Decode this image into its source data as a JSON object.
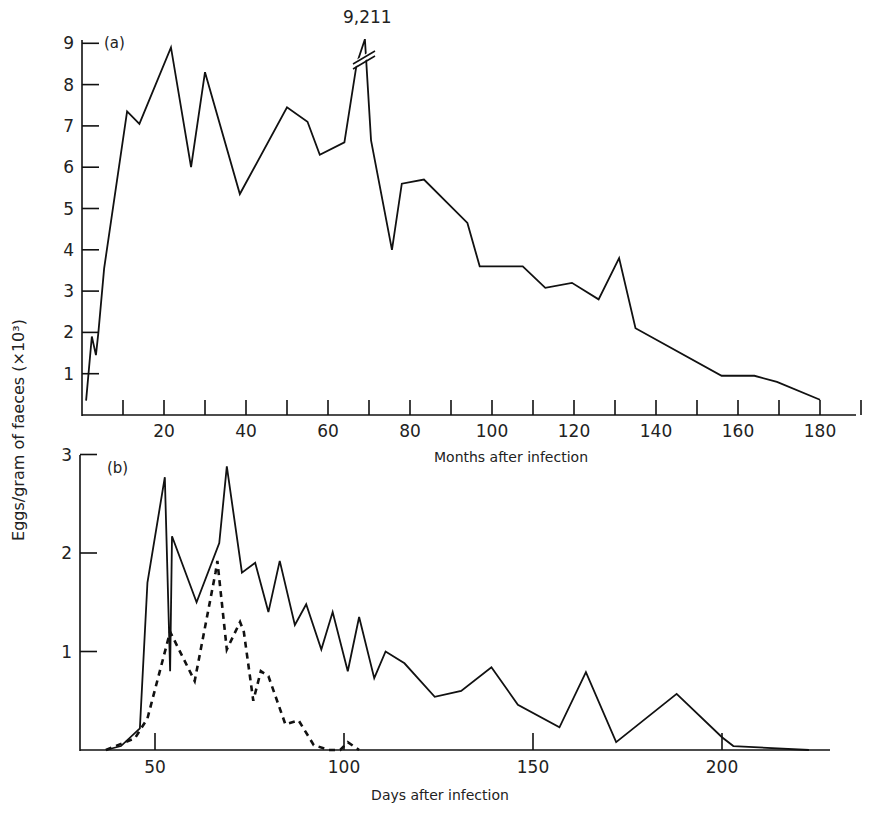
{
  "shared": {
    "ylabel": "Eggs/gram of faeces (×10³)"
  },
  "chart_data": [
    {
      "type": "line",
      "panel": "(a)",
      "title": "",
      "xlabel": "Months after infection",
      "ylabel": "Eggs/gram of faeces (×10³)",
      "xlim": [
        0,
        190
      ],
      "ylim": [
        0,
        9
      ],
      "x_ticks": [
        10,
        20,
        30,
        40,
        50,
        60,
        70,
        80,
        90,
        100,
        110,
        120,
        130,
        140,
        150,
        160,
        170,
        180,
        190
      ],
      "x_tick_labels": [
        "20",
        "40",
        "60",
        "80",
        "100",
        "120",
        "140",
        "160",
        "180"
      ],
      "x_tick_label_values": [
        20,
        40,
        60,
        80,
        100,
        120,
        140,
        160,
        180
      ],
      "y_ticks": [
        1,
        2,
        3,
        4,
        5,
        6,
        7,
        8,
        9
      ],
      "y_tick_labels": [
        "1",
        "2",
        "3",
        "4",
        "5",
        "6",
        "7",
        "8",
        "9"
      ],
      "grid": false,
      "annotations": [
        {
          "text": "9,211",
          "x": 69,
          "y": 9.211,
          "note": "axis break marks on peak"
        }
      ],
      "series": [
        {
          "name": "eggs",
          "style": "solid",
          "x": [
            1,
            2.4,
            3.4,
            4,
            5.4,
            11,
            14,
            21.7,
            26.6,
            30,
            38.5,
            50,
            55,
            58,
            64,
            67,
            69,
            70.5,
            75.6,
            78,
            83.4,
            94,
            97,
            107.5,
            113,
            119.5,
            126,
            131,
            135,
            156,
            164,
            169.5,
            180
          ],
          "values": [
            0.35,
            1.9,
            1.45,
            2.0,
            3.55,
            7.35,
            7.05,
            8.9,
            6.0,
            8.3,
            5.35,
            7.45,
            7.1,
            6.3,
            6.6,
            8.5,
            9.211,
            6.65,
            4.0,
            5.6,
            5.7,
            4.65,
            3.6,
            3.6,
            3.08,
            3.2,
            2.8,
            3.8,
            2.1,
            0.95,
            0.95,
            0.8,
            0.37
          ]
        }
      ]
    },
    {
      "type": "line",
      "panel": "(b)",
      "title": "",
      "xlabel": "Days after infection",
      "ylabel": "Eggs/gram of faeces (×10³)",
      "xlim": [
        30,
        230
      ],
      "ylim": [
        0,
        3
      ],
      "x_ticks": [
        50,
        100,
        150,
        200
      ],
      "x_tick_labels": [
        "50",
        "100",
        "150",
        "200"
      ],
      "y_ticks": [
        1,
        2,
        3
      ],
      "y_tick_labels": [
        "1",
        "2",
        "3"
      ],
      "grid": false,
      "series": [
        {
          "name": "series-solid",
          "style": "solid",
          "x": [
            37,
            41,
            46,
            48,
            52.6,
            54,
            54.5,
            61,
            67,
            69,
            73,
            76.5,
            80,
            83,
            87,
            90,
            94,
            97,
            101,
            104,
            108,
            111,
            116,
            124,
            131,
            139,
            146,
            157,
            164,
            172,
            188,
            200,
            203,
            223
          ],
          "values": [
            0,
            0.04,
            0.22,
            1.7,
            2.77,
            0.8,
            2.17,
            1.5,
            2.1,
            2.88,
            1.8,
            1.9,
            1.4,
            1.92,
            1.27,
            1.48,
            1.02,
            1.4,
            0.8,
            1.35,
            0.73,
            1.0,
            0.88,
            0.54,
            0.6,
            0.84,
            0.46,
            0.23,
            0.79,
            0.08,
            0.57,
            0.13,
            0.04,
            0
          ]
        },
        {
          "name": "series-dashed",
          "style": "dashed",
          "x": [
            37,
            44.7,
            48,
            54,
            60.5,
            66,
            66.5,
            69,
            72.5,
            73.5,
            76,
            78,
            80,
            84.5,
            88,
            92,
            96,
            99,
            101,
            104
          ],
          "values": [
            0,
            0.12,
            0.32,
            1.2,
            0.7,
            1.8,
            1.92,
            1.02,
            1.3,
            1.2,
            0.5,
            0.8,
            0.75,
            0.26,
            0.3,
            0.05,
            0,
            0,
            0.08,
            0
          ]
        }
      ]
    }
  ]
}
